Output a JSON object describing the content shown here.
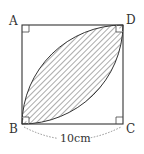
{
  "diagram": {
    "type": "geometry",
    "shape": "square",
    "vertices": {
      "A": "A",
      "B": "B",
      "C": "C",
      "D": "D"
    },
    "dimension_label": "10cm",
    "shaded_region": "lens between quarter-circle arcs centered at A and C, from B to D",
    "right_angle_marks": [
      "A",
      "B",
      "C",
      "D"
    ],
    "colors": {
      "stroke": "#333333",
      "hatch": "#444444",
      "background": "#ffffff",
      "dimension_dash": "#777777"
    }
  }
}
